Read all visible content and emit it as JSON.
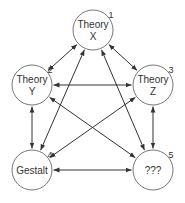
{
  "diagram": {
    "type": "directed-graph",
    "nodes": [
      {
        "id": "1",
        "lines": [
          "Theory",
          "X"
        ],
        "number": "1",
        "cx": 93,
        "cy": 30,
        "r": 20
      },
      {
        "id": "2",
        "lines": [
          "Theory",
          "Y"
        ],
        "number": "2",
        "cx": 32,
        "cy": 85,
        "r": 20
      },
      {
        "id": "3",
        "lines": [
          "Theory",
          "Z"
        ],
        "number": "3",
        "cx": 153,
        "cy": 85,
        "r": 20
      },
      {
        "id": "4",
        "lines": [
          "Gestalt"
        ],
        "number": "4",
        "cx": 32,
        "cy": 170,
        "r": 20
      },
      {
        "id": "5",
        "lines": [
          "???"
        ],
        "number": "5",
        "cx": 153,
        "cy": 170,
        "r": 20
      }
    ],
    "edges": [
      {
        "from": "1",
        "to": "2",
        "bidirectional": true
      },
      {
        "from": "1",
        "to": "3",
        "bidirectional": true
      },
      {
        "from": "2",
        "to": "3",
        "bidirectional": true
      },
      {
        "from": "2",
        "to": "4",
        "bidirectional": true
      },
      {
        "from": "3",
        "to": "5",
        "bidirectional": true
      },
      {
        "from": "4",
        "to": "5",
        "bidirectional": true
      },
      {
        "from": "1",
        "to": "4",
        "bidirectional": true
      },
      {
        "from": "1",
        "to": "5",
        "bidirectional": true
      },
      {
        "from": "2",
        "to": "5",
        "bidirectional": true
      },
      {
        "from": "3",
        "to": "4",
        "bidirectional": true
      }
    ]
  }
}
